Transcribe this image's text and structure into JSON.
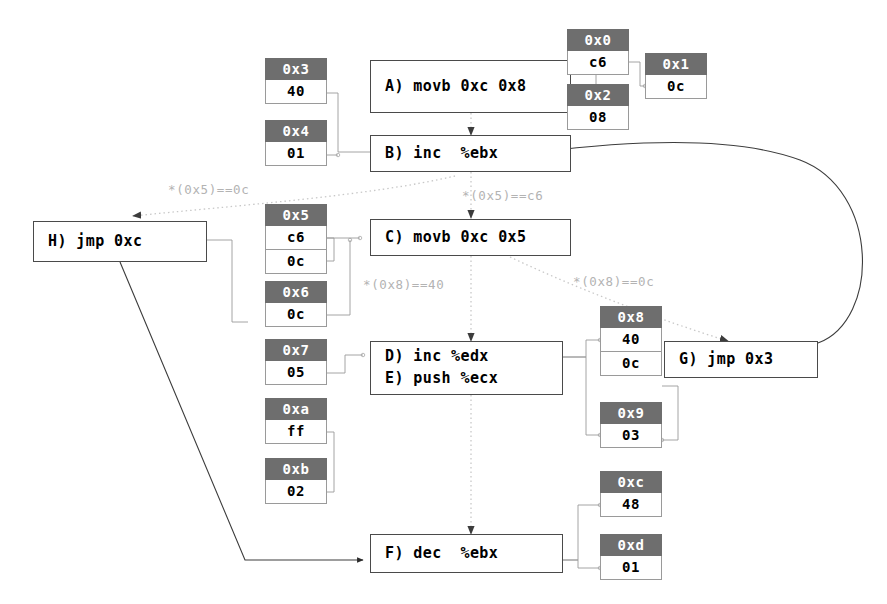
{
  "diagram": {
    "colors": {
      "background": "#ffffff",
      "cell_header": "#6e6e6e",
      "cell_header_text": "#ffffff",
      "node_border": "#4a4a4a",
      "cell_border": "#9a9a9a",
      "solid_edge": "#3c3c3c",
      "dotted_edge": "#c8c8c8",
      "edge_label_text": "#b3b3b3"
    }
  },
  "nodes": [
    {
      "id": "A",
      "text": "A) movb 0xc 0x8",
      "lines": [
        "A) movb 0xc 0x8"
      ]
    },
    {
      "id": "B",
      "text": "B) inc  %ebx",
      "lines": [
        "B) inc  %ebx"
      ]
    },
    {
      "id": "C",
      "text": "C) movb 0xc 0x5",
      "lines": [
        "C) movb 0xc 0x5"
      ]
    },
    {
      "id": "DE",
      "text": "D) inc %edx / E) push %ecx",
      "lines": [
        "D) inc %edx",
        "E) push %ecx"
      ]
    },
    {
      "id": "F",
      "text": "F) dec  %ebx",
      "lines": [
        "F) dec  %ebx"
      ]
    },
    {
      "id": "G",
      "text": "G) jmp 0x3",
      "lines": [
        "G) jmp 0x3"
      ]
    },
    {
      "id": "H",
      "text": "H) jmp 0xc",
      "lines": [
        "H) jmp 0xc"
      ]
    }
  ],
  "memory_cells": [
    {
      "address": "0x0",
      "values": [
        "c6"
      ]
    },
    {
      "address": "0x1",
      "values": [
        "0c"
      ]
    },
    {
      "address": "0x2",
      "values": [
        "08"
      ]
    },
    {
      "address": "0x3",
      "values": [
        "40"
      ]
    },
    {
      "address": "0x4",
      "values": [
        "01"
      ]
    },
    {
      "address": "0x5",
      "values": [
        "c6",
        "0c"
      ]
    },
    {
      "address": "0x6",
      "values": [
        "0c"
      ]
    },
    {
      "address": "0x7",
      "values": [
        "05"
      ]
    },
    {
      "address": "0x8",
      "values": [
        "40",
        "0c"
      ]
    },
    {
      "address": "0x9",
      "values": [
        "03"
      ]
    },
    {
      "address": "0xa",
      "values": [
        "ff"
      ]
    },
    {
      "address": "0xb",
      "values": [
        "02"
      ]
    },
    {
      "address": "0xc",
      "values": [
        "48"
      ]
    },
    {
      "address": "0xd",
      "values": [
        "01"
      ]
    }
  ],
  "edge_labels": [
    {
      "id": "l1",
      "text": "*(0x5)==0c"
    },
    {
      "id": "l2",
      "text": "*(0x5)==c6"
    },
    {
      "id": "l3",
      "text": "*(0x8)==40"
    },
    {
      "id": "l4",
      "text": "*(0x8)==0c"
    }
  ]
}
